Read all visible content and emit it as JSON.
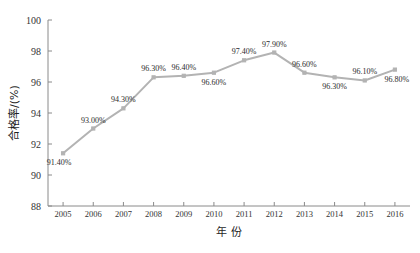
{
  "ghost_text": {
    "top": "",
    "bottom": ""
  },
  "chart_data": {
    "type": "line",
    "title": "",
    "xlabel": "年 份",
    "ylabel": "合格率/(%)",
    "categories": [
      "2005",
      "2006",
      "2007",
      "2008",
      "2009",
      "2010",
      "2011",
      "2012",
      "2013",
      "2014",
      "2015",
      "2016"
    ],
    "values": [
      91.4,
      93.0,
      94.3,
      96.3,
      96.4,
      96.6,
      97.4,
      97.9,
      96.6,
      96.3,
      96.1,
      96.8
    ],
    "point_labels": [
      "91.40%",
      "93.00%",
      "94.30%",
      "96.30%",
      "96.40%",
      "96.60%",
      "97.40%",
      "97.90%",
      "96.60%",
      "96.30%",
      "96.10%",
      "96.80%"
    ],
    "label_positions": [
      "below",
      "above",
      "above",
      "above",
      "above",
      "below",
      "above",
      "above",
      "above",
      "below",
      "above",
      "below"
    ],
    "ylim": [
      88,
      100
    ],
    "yticks": [
      88,
      90,
      92,
      94,
      96,
      98,
      100
    ],
    "ytick_labels": [
      "88",
      "90",
      "92",
      "94",
      "96",
      "98",
      "100"
    ],
    "grid": false,
    "legend": "none",
    "series_color": "#b3b3b3",
    "marker_color": "#b3b3b3",
    "marker_shape": "square",
    "axis_color": "#8a8a8a",
    "background": "#ffffff"
  }
}
